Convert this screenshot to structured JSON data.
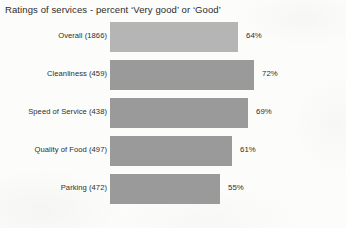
{
  "chart_data": {
    "type": "bar",
    "orientation": "horizontal",
    "title": "Ratings of services - percent ‘Very good’ or ‘Good’",
    "xlabel": "",
    "ylabel": "",
    "xlim": [
      0,
      100
    ],
    "grid": false,
    "legend": null,
    "value_suffix": "%",
    "categories": [
      "Overall (1866)",
      "Cleanliness (459)",
      "Speed of Service (438)",
      "Quality of Food (497)",
      "Parking (472)"
    ],
    "values": [
      64,
      72,
      69,
      61,
      55
    ],
    "value_labels": [
      "64%",
      "72%",
      "69%",
      "61%",
      "55%"
    ],
    "bar_colors": [
      "#b5b5b5",
      "#9a9a9a",
      "#9a9a9a",
      "#9a9a9a",
      "#9a9a9a"
    ],
    "series": [
      {
        "name": "percent ‘Very good’ or ‘Good’",
        "values": [
          64,
          72,
          69,
          61,
          55
        ]
      }
    ],
    "bars": [
      {
        "category": "Overall (1866)",
        "label": "Overall (1866)",
        "value": 64,
        "value_label": "64%",
        "base_count": 1866,
        "color": "#b5b5b5"
      },
      {
        "category": "Cleanliness (459)",
        "label": "Cleanliness (459)",
        "value": 72,
        "value_label": "72%",
        "base_count": 459,
        "color": "#9a9a9a"
      },
      {
        "category": "Speed of Service (438)",
        "label": "Speed of Service (438)",
        "value": 69,
        "value_label": "69%",
        "base_count": 438,
        "color": "#9a9a9a"
      },
      {
        "category": "Quality of Food (497)",
        "label": "Quality of Food (497)",
        "value": 61,
        "value_label": "61%",
        "base_count": 497,
        "color": "#9a9a9a"
      },
      {
        "category": "Parking (472)",
        "label": "Parking (472)",
        "value": 55,
        "value_label": "55%",
        "base_count": 472,
        "color": "#9a9a9a"
      }
    ]
  },
  "colors": {
    "background": "#fcfcfa",
    "bar_primary": "#9a9a9a",
    "bar_highlight": "#b5b5b5",
    "text": "#2b2b2b"
  }
}
